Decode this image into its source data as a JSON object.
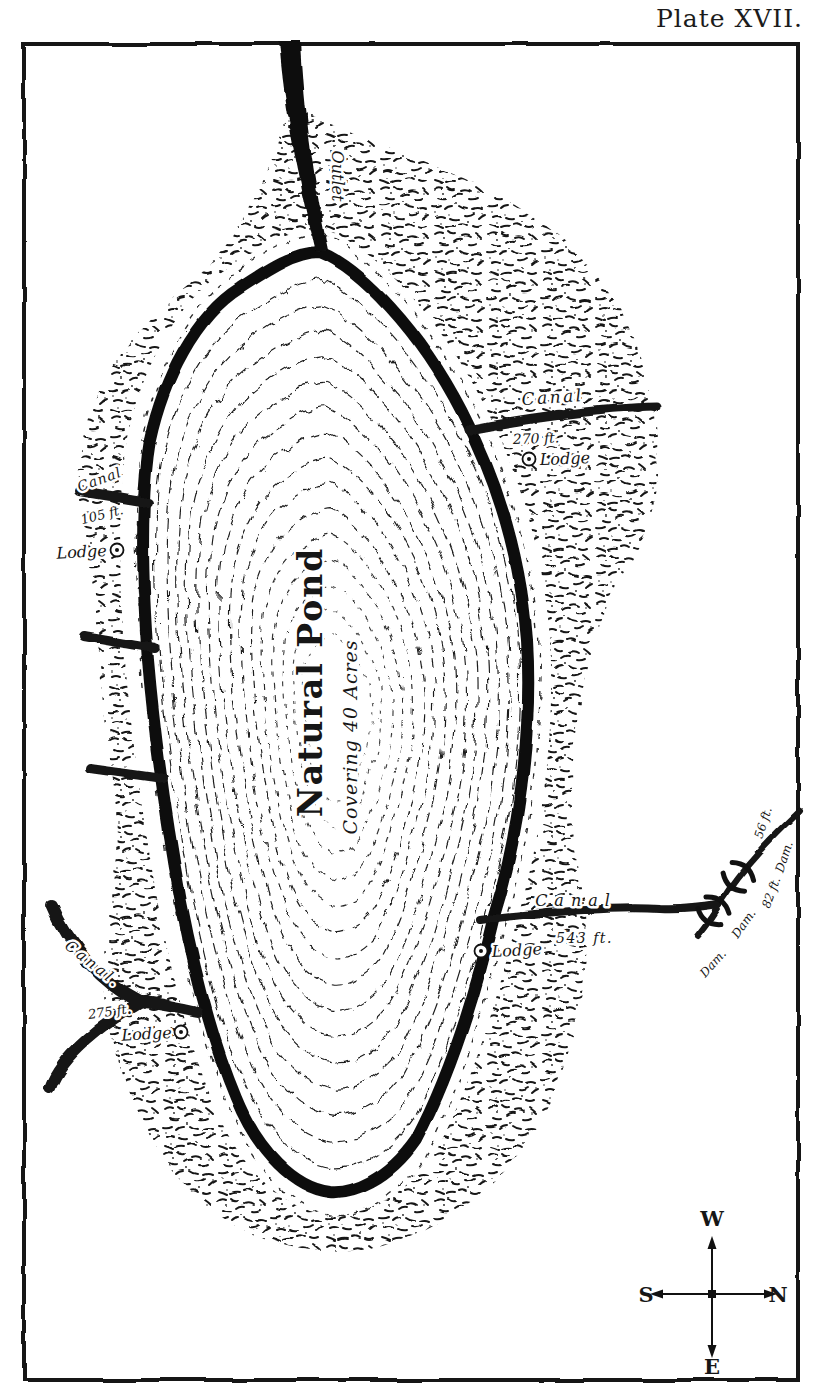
{
  "plate": {
    "title": "Plate XVII."
  },
  "map": {
    "pond": {
      "title": "Natural Pond",
      "subtitle": "Covering 40 Acres"
    },
    "outlet": {
      "label": "Outlet"
    },
    "canal_top_right": {
      "label": "Canal",
      "length": "270 ft.",
      "lodge": "Lodge"
    },
    "canal_left": {
      "label": "Canal",
      "length": "105 ft.",
      "lodge": "Lodge"
    },
    "canal_bottom_left": {
      "label": "Canal.",
      "length": "275 ft.",
      "lodge": "Lodge"
    },
    "canal_right": {
      "label": "Canal",
      "length": "543 ft.",
      "lodge": "Lodge"
    },
    "dams": {
      "labels": [
        "Dam.",
        "Dam.",
        "Dam."
      ],
      "lengths": [
        "56 ft.",
        "82 ft."
      ]
    },
    "compass": {
      "top": "W",
      "left": "S",
      "right": "N",
      "bottom": "E"
    }
  },
  "colors": {
    "ink": "#1b1b1b",
    "paper": "#ffffff"
  }
}
